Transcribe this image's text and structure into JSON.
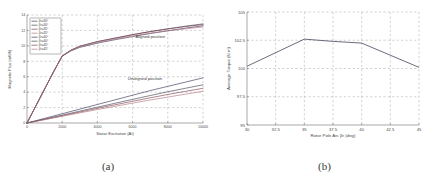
{
  "figure": {
    "panels": [
      {
        "caption": "(a)"
      },
      {
        "caption": "(b)"
      }
    ]
  },
  "chart_data": [
    {
      "type": "line",
      "panel": "(a)",
      "title": "",
      "xlabel": "Stator Excitation (At)",
      "ylabel": "Magnetic Flux (mWb)",
      "xlim": [
        0,
        10000
      ],
      "ylim": [
        0,
        14
      ],
      "xticks": [
        0,
        2000,
        4000,
        6000,
        8000,
        10000
      ],
      "xticklabels": [
        "0",
        "2000",
        "4000",
        "6000",
        "8000",
        "10000"
      ],
      "yticks": [
        0,
        2,
        4,
        6,
        8,
        10,
        12,
        14
      ],
      "yticklabels": [
        "0",
        "2",
        "4",
        "6",
        "8",
        "10",
        "12",
        "14"
      ],
      "grid": true,
      "legend_position": "upper left",
      "annotations": [
        {
          "text": "Aligned position",
          "x": 7000,
          "y": 11.0
        },
        {
          "text": "Unaligned position",
          "x": 6700,
          "y": 5.6
        }
      ],
      "x": [
        0,
        500,
        1000,
        1500,
        2000,
        2500,
        3000,
        4000,
        5000,
        6000,
        7000,
        8000,
        9000,
        10000
      ],
      "series": [
        {
          "name": "βr=30°",
          "group": "Aligned position",
          "color": "#2f2f52",
          "values": [
            0,
            2.2,
            4.4,
            6.6,
            8.65,
            9.35,
            9.8,
            10.35,
            10.8,
            11.2,
            11.6,
            11.95,
            12.3,
            12.6
          ]
        },
        {
          "name": "βr=35°",
          "group": "Aligned position",
          "color": "#3a3a4e",
          "values": [
            0,
            2.2,
            4.4,
            6.6,
            8.7,
            9.45,
            9.95,
            10.55,
            11.0,
            11.45,
            11.85,
            12.2,
            12.55,
            12.85
          ]
        },
        {
          "name": "βr=40°",
          "group": "Aligned position",
          "color": "#7a3a46",
          "values": [
            0,
            2.2,
            4.4,
            6.6,
            8.7,
            9.45,
            9.95,
            10.55,
            11.0,
            11.45,
            11.85,
            12.2,
            12.5,
            12.75
          ]
        },
        {
          "name": "βr=45°",
          "group": "Aligned position",
          "color": "#b0707c",
          "values": [
            0,
            2.2,
            4.4,
            6.6,
            8.7,
            9.4,
            9.9,
            10.45,
            10.9,
            11.3,
            11.65,
            11.95,
            12.2,
            12.45
          ]
        },
        {
          "name": "βr=30°",
          "group": "Unaligned position",
          "color": "#2f2f52",
          "values": [
            0,
            0.3,
            0.6,
            0.9,
            1.2,
            1.5,
            1.8,
            2.4,
            3.0,
            3.6,
            4.2,
            4.75,
            5.3,
            5.85
          ]
        },
        {
          "name": "βr=35°",
          "group": "Unaligned position",
          "color": "#3a3a4e",
          "values": [
            0,
            0.25,
            0.5,
            0.76,
            1.02,
            1.28,
            1.54,
            2.05,
            2.56,
            3.06,
            3.56,
            4.05,
            4.5,
            4.95
          ]
        },
        {
          "name": "βr=40°",
          "group": "Unaligned position",
          "color": "#7a3a46",
          "values": [
            0,
            0.23,
            0.46,
            0.7,
            0.94,
            1.18,
            1.42,
            1.9,
            2.36,
            2.82,
            3.26,
            3.7,
            4.1,
            4.5
          ]
        },
        {
          "name": "βr=45°",
          "group": "Unaligned position",
          "color": "#b0707c",
          "values": [
            0,
            0.21,
            0.43,
            0.65,
            0.87,
            1.09,
            1.31,
            1.74,
            2.16,
            2.58,
            2.98,
            3.36,
            3.74,
            4.1
          ]
        }
      ],
      "legend": [
        "βr=30°",
        "βr=30°",
        "βr=35°",
        "βr=35°",
        "βr=40°",
        "βr=40°",
        "βr=45°",
        "βr=45°"
      ]
    },
    {
      "type": "line",
      "panel": "(b)",
      "title": "",
      "xlabel": "Rotor Pole Arc βr (deg)",
      "ylabel": "Average Torque (N.m)",
      "xlim": [
        30,
        45
      ],
      "ylim": [
        95,
        105
      ],
      "xticks": [
        30,
        32.5,
        35,
        37.5,
        40,
        42.5,
        45
      ],
      "xticklabels": [
        "30",
        "32.5",
        "35",
        "37.5",
        "40",
        "42.5",
        "45"
      ],
      "yticks": [
        95,
        97.5,
        100,
        102.5,
        105
      ],
      "yticklabels": [
        "95",
        "97.5",
        "100",
        "102.5",
        "105"
      ],
      "grid": true,
      "categories": [
        30,
        35,
        37.5,
        40,
        45
      ],
      "values": [
        100.2,
        102.6,
        102.4,
        102.25,
        100.1
      ],
      "series": [
        {
          "name": "Average Torque",
          "color": "#2b2b48",
          "x": [
            30,
            35,
            37.5,
            40,
            45
          ],
          "values": [
            100.2,
            102.6,
            102.4,
            102.25,
            100.1
          ]
        }
      ]
    }
  ]
}
